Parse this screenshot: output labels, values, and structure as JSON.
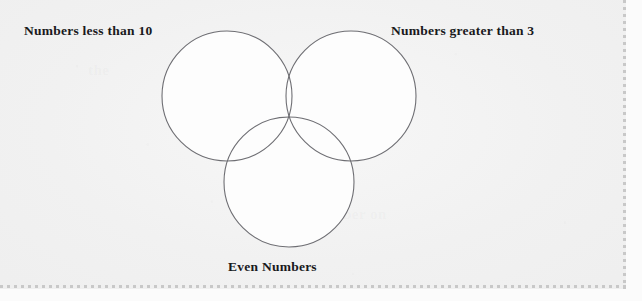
{
  "page": {
    "width": 642,
    "height": 301,
    "background_color": "#f1f1f1",
    "border_style": "dashed",
    "border_color": "#c8c8c8"
  },
  "diagram": {
    "type": "venn",
    "set_count": 3,
    "stroke_color": "#6e6e73",
    "fill_color": "#fdfdfd",
    "stroke_width": 1.1,
    "circles": [
      {
        "id": "left",
        "label": "Numbers less than 10",
        "cx": 227,
        "cy": 96,
        "r": 65
      },
      {
        "id": "right",
        "label": "Numbers greater than 3",
        "cx": 351,
        "cy": 96,
        "r": 65
      },
      {
        "id": "bottom",
        "label": "Even Numbers",
        "cx": 289,
        "cy": 182,
        "r": 65
      }
    ],
    "labels": {
      "left": "Numbers less than 10",
      "right": "Numbers greater than 3",
      "bottom": "Even Numbers"
    },
    "regions": [
      "left only",
      "right only",
      "bottom only",
      "left ∩ right",
      "left ∩ bottom",
      "right ∩ bottom",
      "left ∩ right ∩ bottom"
    ],
    "region_contents": [
      "",
      "",
      "",
      "",
      "",
      "",
      ""
    ]
  },
  "ghost_text": {
    "line_a": "the",
    "line_b": "a number on"
  }
}
